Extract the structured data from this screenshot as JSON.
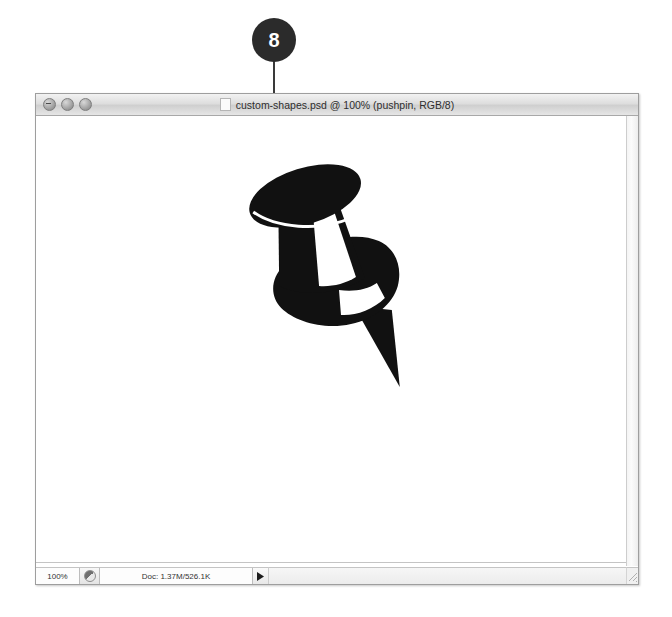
{
  "callout": {
    "number": "8",
    "badge_color": "#2b2b2b",
    "text_color": "#ffffff",
    "leader_line_color": "#3a3a3a"
  },
  "window": {
    "title": "custom-shapes.psd @ 100% (pushpin, RGB/8)",
    "doc_icon_name": "document-icon",
    "controls": [
      {
        "name": "close-button",
        "label": "Close"
      },
      {
        "name": "minimize-button",
        "label": "Minimize"
      },
      {
        "name": "zoom-button",
        "label": "Zoom"
      }
    ]
  },
  "canvas": {
    "background_color": "#ffffff",
    "artwork_name": "pushpin-custom-shape",
    "artwork_fill": "#111111"
  },
  "status_bar": {
    "zoom_level": "100%",
    "preview_mode_icon": "preview-toggle-icon",
    "doc_size": "Doc: 1.37M/526.1K",
    "popup_arrow_icon": "triangle-right-icon"
  }
}
